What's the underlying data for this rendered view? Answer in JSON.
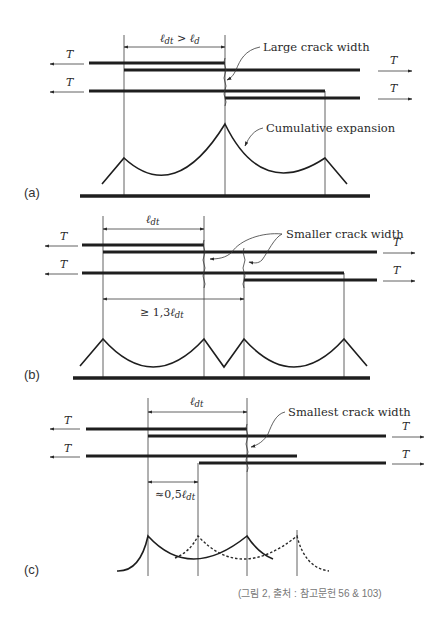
{
  "figure": {
    "caption": "(그림 2, 출처 : 참고문헌 56 & 103)",
    "tension_label": "T",
    "panels": {
      "a": {
        "label": "(a)",
        "dimension_label_main": "ℓ",
        "dimension_label_sub": "dt",
        "dimension_relation": " > ",
        "dimension_label_main2": "ℓ",
        "dimension_label_sub2": "d",
        "annotation_crack": "Large crack width",
        "annotation_curve": "Cumulative expansion"
      },
      "b": {
        "label": "(b)",
        "dimension_label_main": "ℓ",
        "dimension_label_sub": "dt",
        "spacing_label_prefix": "≥ 1,3",
        "spacing_label_main": "ℓ",
        "spacing_label_sub": "dt",
        "annotation_crack": "Smaller crack width"
      },
      "c": {
        "label": "(c)",
        "dimension_label_main": "ℓ",
        "dimension_label_sub": "dt",
        "spacing_label_prefix": "≈0,5",
        "spacing_label_main": "ℓ",
        "spacing_label_sub": "dt",
        "annotation_crack": "Smallest crack width"
      }
    }
  }
}
